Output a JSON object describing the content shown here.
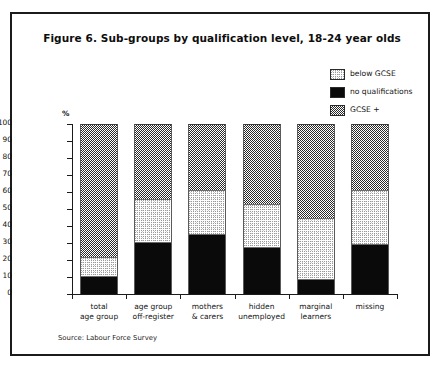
{
  "figure": {
    "title": "Figure 6. Sub-groups by qualification level, 18-24 year olds",
    "source": "Source: Labour Force Survey",
    "y_axis_unit": "%"
  },
  "legend": {
    "items": [
      {
        "label": "below GCSE",
        "swatch": "light-stipple",
        "color": "#fdfdfd"
      },
      {
        "label": "no qualifications",
        "swatch": "solid-black",
        "color": "#0a0a0a"
      },
      {
        "label": "GCSE +",
        "swatch": "dark-checker",
        "color": "#2b2b2b"
      }
    ]
  },
  "chart_data": {
    "type": "bar",
    "subtype": "stacked-100",
    "title": "Figure 6. Sub-groups by qualification level, 18-24 year olds",
    "xlabel": "",
    "ylabel": "%",
    "ylim": [
      0,
      100
    ],
    "yticks": [
      0,
      10,
      20,
      30,
      40,
      50,
      60,
      70,
      80,
      90,
      100
    ],
    "grid": false,
    "legend_position": "top-right",
    "categories": [
      "total age group",
      "age group off-register",
      "mothers & carers",
      "hidden unemployed",
      "marginal learners",
      "missing"
    ],
    "category_lines": [
      [
        "total",
        "age group"
      ],
      [
        "age group",
        "off-register"
      ],
      [
        "mothers",
        "& carers"
      ],
      [
        "hidden",
        "unemployed"
      ],
      [
        "marginal",
        "learners"
      ],
      [
        "missing",
        ""
      ]
    ],
    "series": [
      {
        "name": "no qualifications",
        "values": [
          10,
          30,
          35,
          27,
          8,
          29
        ]
      },
      {
        "name": "below GCSE",
        "values": [
          12,
          26,
          26,
          26,
          37,
          32
        ]
      },
      {
        "name": "GCSE +",
        "values": [
          78,
          44,
          39,
          47,
          55,
          39
        ]
      }
    ],
    "stack_tops": {
      "no qualifications": [
        10,
        30,
        35,
        27,
        8,
        29
      ],
      "below GCSE": [
        22,
        56,
        61,
        53,
        45,
        61
      ],
      "GCSE +": [
        100,
        100,
        100,
        100,
        100,
        100
      ]
    },
    "source": "Source: Labour Force Survey"
  }
}
